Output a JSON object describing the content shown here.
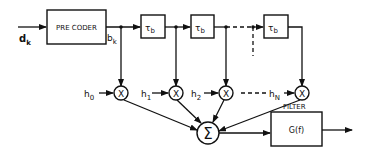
{
  "diagram": {
    "type": "block-diagram",
    "input_label": "d",
    "input_sub": "k",
    "precoder_label": "PRE CODER",
    "precoder_out_label": "b",
    "precoder_out_sub": "k",
    "delay_label": "τ",
    "delay_sub": "b",
    "delays": [
      {
        "id": "delay-1"
      },
      {
        "id": "delay-2"
      },
      {
        "id": "delay-3"
      }
    ],
    "weights": [
      {
        "label": "h",
        "sub": "0"
      },
      {
        "label": "h",
        "sub": "1"
      },
      {
        "label": "h",
        "sub": "2"
      },
      {
        "label": "h",
        "sub": "N"
      }
    ],
    "multiplier_symbol": "X",
    "sum_symbol": "Σ",
    "filter_title": "FILTER",
    "filter_label": "G(f)"
  }
}
